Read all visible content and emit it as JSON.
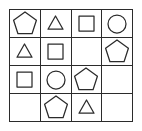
{
  "figure": {
    "kind": "shape-matrix-puzzle",
    "rows": 4,
    "columns": 4,
    "stroke_color": "#2b2b2b",
    "background_color": "#ffffff",
    "fill": "none"
  },
  "legend": {
    "pentagon_label": "pentagon",
    "triangle_label": "triangle",
    "square_label": "square",
    "circle_label": "circle",
    "empty_label": "empty"
  },
  "grid": {
    "cells": [
      {
        "row": 1,
        "col": 1,
        "shape": "pentagon",
        "size": "large"
      },
      {
        "row": 1,
        "col": 2,
        "shape": "triangle",
        "size": "small"
      },
      {
        "row": 1,
        "col": 3,
        "shape": "square",
        "size": "small"
      },
      {
        "row": 1,
        "col": 4,
        "shape": "circle",
        "size": "medium"
      },
      {
        "row": 2,
        "col": 1,
        "shape": "triangle",
        "size": "small"
      },
      {
        "row": 2,
        "col": 2,
        "shape": "square",
        "size": "small"
      },
      {
        "row": 2,
        "col": 3,
        "shape": "empty",
        "size": "none"
      },
      {
        "row": 2,
        "col": 4,
        "shape": "pentagon",
        "size": "large"
      },
      {
        "row": 3,
        "col": 1,
        "shape": "square",
        "size": "small"
      },
      {
        "row": 3,
        "col": 2,
        "shape": "circle",
        "size": "medium"
      },
      {
        "row": 3,
        "col": 3,
        "shape": "pentagon",
        "size": "large"
      },
      {
        "row": 3,
        "col": 4,
        "shape": "empty",
        "size": "none"
      },
      {
        "row": 4,
        "col": 1,
        "shape": "empty",
        "size": "none"
      },
      {
        "row": 4,
        "col": 2,
        "shape": "pentagon",
        "size": "large"
      },
      {
        "row": 4,
        "col": 3,
        "shape": "triangle",
        "size": "small"
      },
      {
        "row": 4,
        "col": 4,
        "shape": "empty",
        "size": "none"
      }
    ]
  }
}
